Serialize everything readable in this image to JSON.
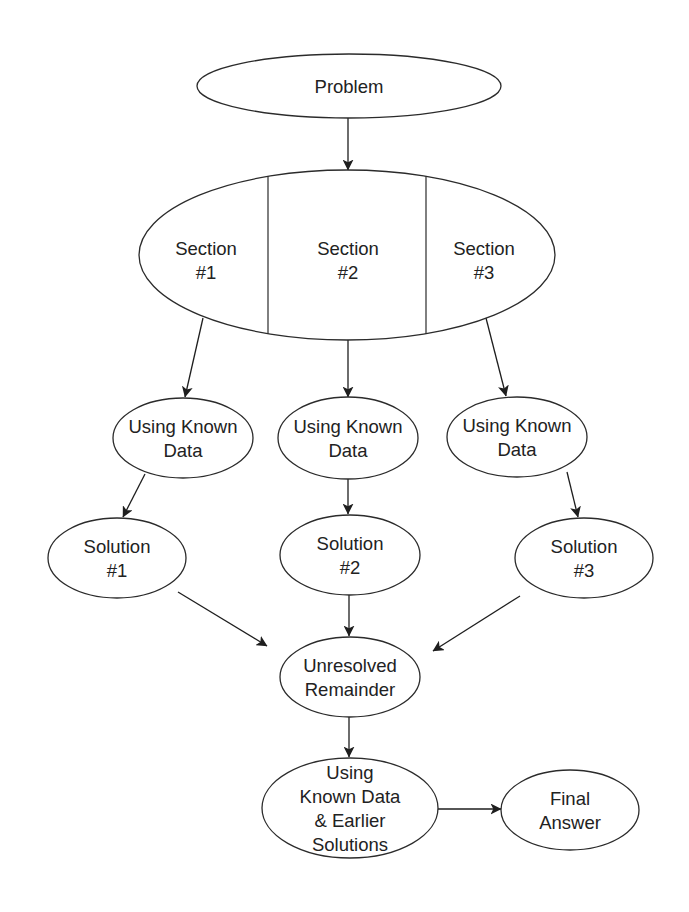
{
  "diagram": {
    "title": "",
    "colors": {
      "background": "#ffffff",
      "stroke": "#2b2b2b",
      "text": "#222222",
      "arrow": "#1e1e1e"
    },
    "nodes": [
      {
        "id": "problem",
        "label_lines": [
          "Problem"
        ],
        "cx": 349,
        "cy": 86,
        "rx": 152,
        "ry": 32
      },
      {
        "id": "sections",
        "label_lines": [],
        "cx": 347,
        "cy": 255,
        "rx": 208,
        "ry": 85,
        "dividers": [
          268,
          426
        ],
        "sections": [
          {
            "id": "section-1",
            "label_lines": [
              "Section",
              "#1"
            ],
            "x": 206,
            "y": 260
          },
          {
            "id": "section-2",
            "label_lines": [
              "Section",
              "#2"
            ],
            "x": 348,
            "y": 260
          },
          {
            "id": "section-3",
            "label_lines": [
              "Section",
              "#3"
            ],
            "x": 484,
            "y": 260
          }
        ]
      },
      {
        "id": "known-data-1",
        "label_lines": [
          "Using Known",
          "Data"
        ],
        "cx": 183,
        "cy": 438,
        "rx": 70,
        "ry": 40
      },
      {
        "id": "known-data-2",
        "label_lines": [
          "Using Known",
          "Data"
        ],
        "cx": 348,
        "cy": 438,
        "rx": 70,
        "ry": 41
      },
      {
        "id": "known-data-3",
        "label_lines": [
          "Using Known",
          "Data"
        ],
        "cx": 517,
        "cy": 437,
        "rx": 70,
        "ry": 40
      },
      {
        "id": "solution-1",
        "label_lines": [
          "Solution",
          "#1"
        ],
        "cx": 117,
        "cy": 558,
        "rx": 69,
        "ry": 40
      },
      {
        "id": "solution-2",
        "label_lines": [
          "Solution",
          "#2"
        ],
        "cx": 350,
        "cy": 555,
        "rx": 70,
        "ry": 40
      },
      {
        "id": "solution-3",
        "label_lines": [
          "Solution",
          "#3"
        ],
        "cx": 584,
        "cy": 558,
        "rx": 69,
        "ry": 40
      },
      {
        "id": "unresolved-remainder",
        "label_lines": [
          "Unresolved",
          "Remainder"
        ],
        "cx": 350,
        "cy": 677,
        "rx": 70,
        "ry": 40
      },
      {
        "id": "known-data-earlier-solutions",
        "label_lines": [
          "Using",
          "Known Data",
          "& Earlier",
          "Solutions"
        ],
        "cx": 350,
        "cy": 808,
        "rx": 88,
        "ry": 50
      },
      {
        "id": "final-answer",
        "label_lines": [
          "Final",
          "Answer"
        ],
        "cx": 570,
        "cy": 810,
        "rx": 69,
        "ry": 40
      }
    ],
    "edges": [
      {
        "from": "problem",
        "to": "sections",
        "x1": 348,
        "y1": 118,
        "x2": 348,
        "y2": 170
      },
      {
        "from": "section-1",
        "to": "known-data-1",
        "x1": 203,
        "y1": 318,
        "x2": 185,
        "y2": 397
      },
      {
        "from": "section-2",
        "to": "known-data-2",
        "x1": 348,
        "y1": 340,
        "x2": 348,
        "y2": 397
      },
      {
        "from": "section-3",
        "to": "known-data-3",
        "x1": 486,
        "y1": 318,
        "x2": 506,
        "y2": 396
      },
      {
        "from": "known-data-1",
        "to": "solution-1",
        "x1": 145,
        "y1": 474,
        "x2": 123,
        "y2": 517
      },
      {
        "from": "known-data-2",
        "to": "solution-2",
        "x1": 348,
        "y1": 479,
        "x2": 348,
        "y2": 514
      },
      {
        "from": "known-data-3",
        "to": "solution-3",
        "x1": 567,
        "y1": 472,
        "x2": 578,
        "y2": 517
      },
      {
        "from": "solution-1",
        "to": "unresolved-remainder",
        "x1": 178,
        "y1": 592,
        "x2": 267,
        "y2": 646
      },
      {
        "from": "solution-2",
        "to": "unresolved-remainder",
        "x1": 349,
        "y1": 595,
        "x2": 349,
        "y2": 636
      },
      {
        "from": "solution-3",
        "to": "unresolved-remainder",
        "x1": 520,
        "y1": 596,
        "x2": 433,
        "y2": 651
      },
      {
        "from": "unresolved-remainder",
        "to": "known-data-earlier-solutions",
        "x1": 349,
        "y1": 717,
        "x2": 349,
        "y2": 757
      },
      {
        "from": "known-data-earlier-solutions",
        "to": "final-answer",
        "x1": 438,
        "y1": 809,
        "x2": 501,
        "y2": 809
      }
    ],
    "line_height": 24
  }
}
